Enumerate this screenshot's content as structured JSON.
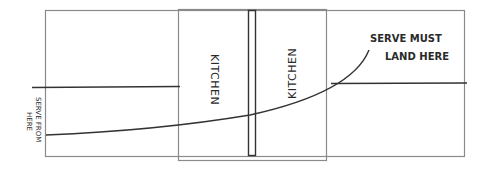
{
  "diagram": {
    "labels": {
      "kitchen_left": "KITCHEN",
      "kitchen_right": "KITCHEN",
      "serve_from_line1": "SERVE FROM",
      "serve_from_line2": "HERE",
      "serve_must_line1": "SERVE MUST",
      "serve_must_line2": "LAND HERE"
    },
    "colors": {
      "court_lines": "#8a8a8a",
      "net": "#333333",
      "serve_path": "#333333",
      "text": "#2a2a2a"
    }
  }
}
